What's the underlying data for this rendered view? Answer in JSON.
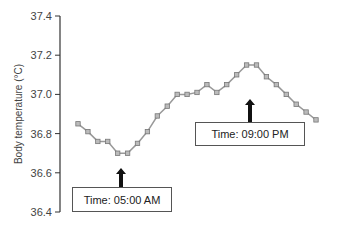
{
  "chart_data": {
    "type": "line",
    "title": "",
    "xlabel": "",
    "ylabel": "Body temperature (°C)",
    "ylim": [
      36.4,
      37.4
    ],
    "yticks": [
      36.4,
      36.6,
      36.8,
      37.0,
      37.2,
      37.4
    ],
    "ytick_labels": [
      "36.4",
      "36.6",
      "36.8",
      "37.0",
      "37.2",
      "37.4"
    ],
    "grid": false,
    "legend": null,
    "values_are_estimates": true,
    "estimate_note": "Values are read visually off the rendered axis (approx. ±0.01–0.02 °C); not measured data.",
    "series": [
      {
        "name": "Body temperature",
        "color": "#999999",
        "marker": "square",
        "values": [
          36.85,
          36.81,
          36.76,
          36.76,
          36.7,
          36.7,
          36.75,
          36.81,
          36.89,
          36.94,
          37.0,
          37.0,
          37.01,
          37.05,
          37.01,
          37.05,
          37.1,
          37.15,
          37.15,
          37.09,
          37.05,
          37.0,
          36.95,
          36.91,
          36.87
        ]
      }
    ],
    "annotations": [
      {
        "text": "Time: 05:00 AM",
        "points_to_index": 5,
        "type": "minimum"
      },
      {
        "text": "Time: 09:00 PM",
        "points_to_index": 17,
        "type": "maximum"
      }
    ]
  },
  "axis": {
    "ylabel": "Body temperature (°C)",
    "ticks": [
      "37.4",
      "37.2",
      "37.0",
      "36.8",
      "36.6",
      "36.4"
    ]
  },
  "annotations": {
    "morning": "Time: 05:00 AM",
    "evening": "Time: 09:00 PM"
  },
  "colors": {
    "line": "#999999",
    "marker_fill": "#bbbbbb",
    "marker_stroke": "#777777",
    "axis": "#333333",
    "arrow": "#111111"
  }
}
